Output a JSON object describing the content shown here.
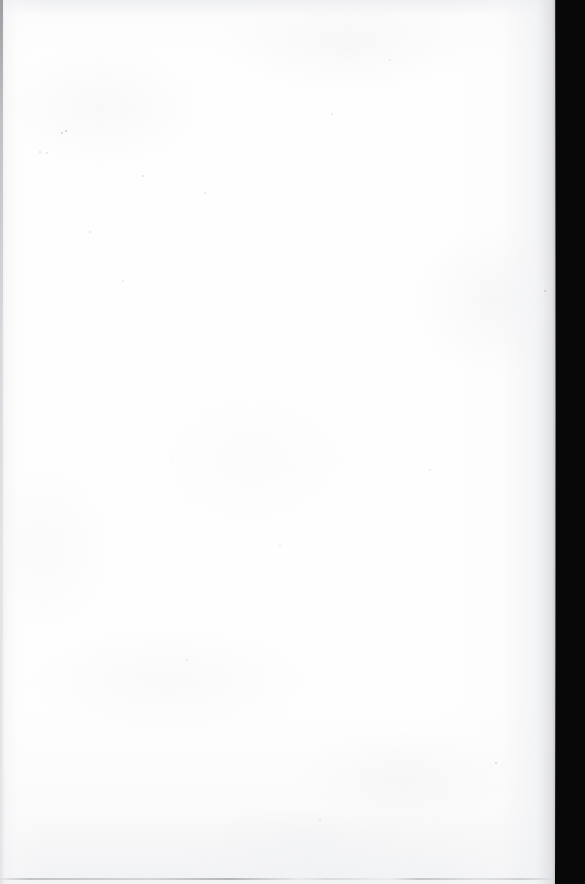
{
  "document": {
    "kind": "scanned-page",
    "content_description": "Blank page",
    "visible_text": "",
    "text_blocks": [],
    "figures": [],
    "page_number": "",
    "header": "",
    "footer": ""
  },
  "scan": {
    "width_px": 585,
    "height_px": 884,
    "page_width_px": 561,
    "paper_color": "#fefefe",
    "backdrop_color": "#080808",
    "left_rule_color": "#96979b",
    "bottom_rule_color": "#b0b1b6",
    "edge_falloff_color": "#a9aaae"
  },
  "artifacts": {
    "left_edge_rule": "thin gray vertical line at the left margin, darkest at top",
    "right_backdrop": "solid near-black scanner background beyond the page edge",
    "bottom_edge_rule": "faint broken gray line along the bottom page edge",
    "paper_grain": "faint mottled paper texture",
    "specks": [
      {
        "x": 66,
        "y": 131,
        "size": 2.0,
        "color": "rgba(176,170,172,0.60)"
      },
      {
        "x": 62,
        "y": 133,
        "size": 1.4,
        "color": "rgba(188,182,184,0.50)"
      },
      {
        "x": 40,
        "y": 152,
        "size": 1.6,
        "color": "rgba(196,192,194,0.45)"
      },
      {
        "x": 47,
        "y": 153,
        "size": 1.2,
        "color": "rgba(204,200,202,0.40)"
      },
      {
        "x": 143,
        "y": 176,
        "size": 1.5,
        "color": "rgba(198,194,196,0.42)"
      },
      {
        "x": 205,
        "y": 193,
        "size": 1.3,
        "color": "rgba(206,202,204,0.38)"
      },
      {
        "x": 90,
        "y": 232,
        "size": 1.4,
        "color": "rgba(202,198,200,0.40)"
      },
      {
        "x": 332,
        "y": 114,
        "size": 1.3,
        "color": "rgba(208,204,206,0.36)"
      },
      {
        "x": 390,
        "y": 60,
        "size": 1.2,
        "color": "rgba(210,206,208,0.34)"
      },
      {
        "x": 545,
        "y": 291,
        "size": 1.8,
        "color": "rgba(168,164,166,0.50)"
      },
      {
        "x": 123,
        "y": 281,
        "size": 1.3,
        "color": "rgba(206,202,204,0.36)"
      },
      {
        "x": 496,
        "y": 763,
        "size": 2.2,
        "color": "rgba(182,178,180,0.52)"
      },
      {
        "x": 280,
        "y": 546,
        "size": 1.2,
        "color": "rgba(210,206,208,0.34)"
      },
      {
        "x": 187,
        "y": 660,
        "size": 1.4,
        "color": "rgba(204,200,202,0.38)"
      },
      {
        "x": 430,
        "y": 470,
        "size": 1.2,
        "color": "rgba(212,208,210,0.32)"
      },
      {
        "x": 320,
        "y": 820,
        "size": 1.3,
        "color": "rgba(206,202,204,0.36)"
      }
    ]
  }
}
